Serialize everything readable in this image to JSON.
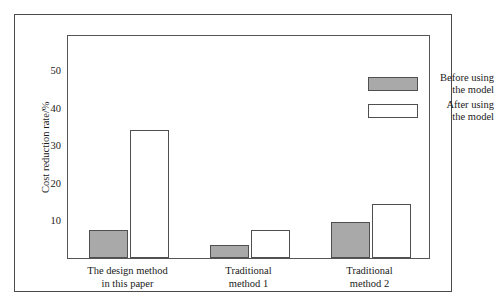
{
  "chart_data": {
    "type": "bar",
    "title": "",
    "xlabel": "",
    "ylabel": "Cost reduction rate/%",
    "ylim": [
      0,
      59.7
    ],
    "yticks": [
      10,
      20,
      30,
      40,
      50
    ],
    "ytick_labels": [
      "10",
      "20",
      "30",
      "40",
      "50"
    ],
    "grid": false,
    "legend_position": "top-right",
    "categories": [
      "The design method in this paper",
      "Traditional method 1",
      "Traditional method 2"
    ],
    "category_lines": [
      [
        "The design method",
        "in this paper"
      ],
      [
        "Traditional",
        "method 1"
      ],
      [
        "Traditional",
        "method 2"
      ]
    ],
    "series": [
      {
        "name": "Before using the model",
        "name_lines": [
          "Before using",
          "the model"
        ],
        "fill": "#a9a9a9",
        "values": [
          7.5,
          3.5,
          9.5
        ]
      },
      {
        "name": "After using the model",
        "name_lines": [
          "After using",
          "the model"
        ],
        "fill": "#ffffff",
        "values": [
          34.0,
          7.5,
          14.5
        ]
      }
    ]
  },
  "colors": {
    "before_fill": "#a9a9a9",
    "after_fill": "#ffffff",
    "bar_stroke": "#4f4f4f",
    "axis": "#555555",
    "frame": "#4a4a4a",
    "background": "#ffffff",
    "text": "#1a1a1a"
  }
}
